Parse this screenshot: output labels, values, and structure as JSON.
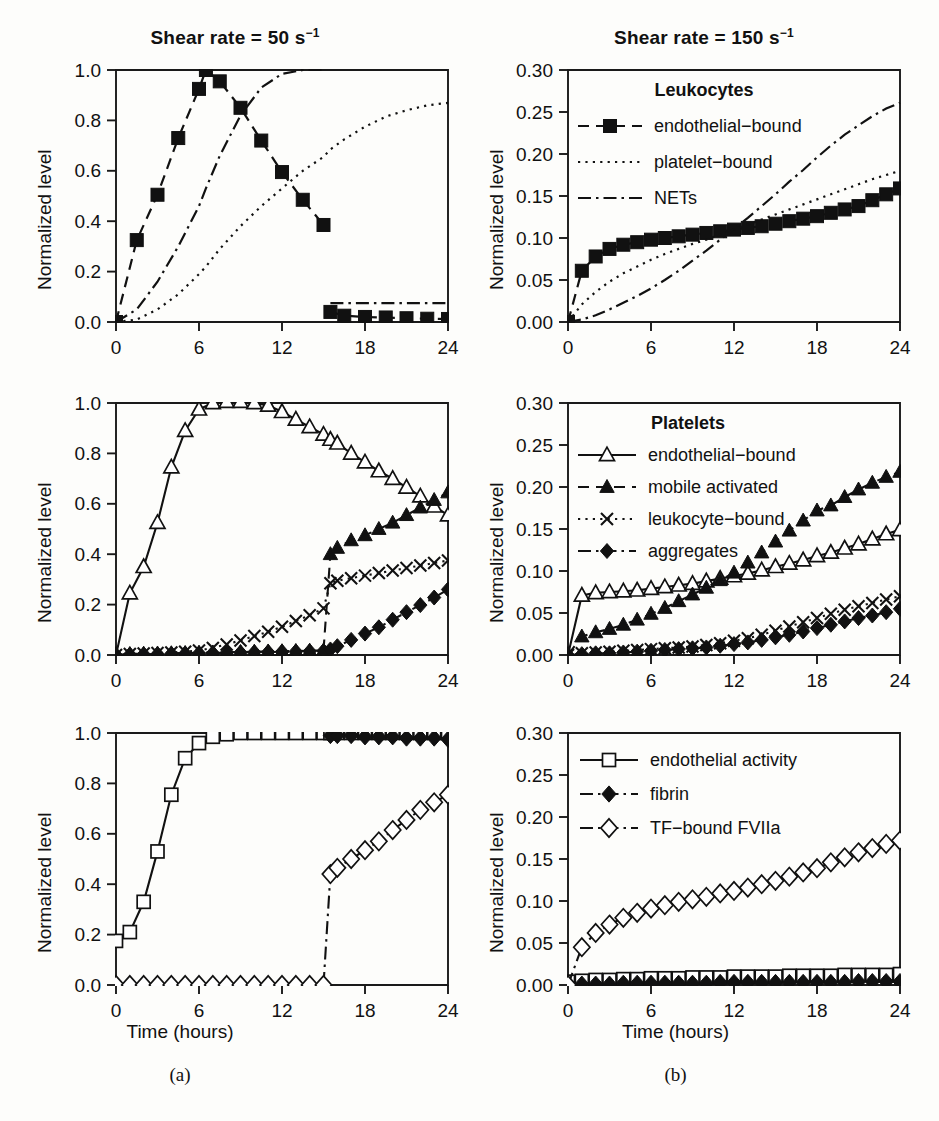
{
  "figure": {
    "subcaptions": [
      "(a)",
      "(b)"
    ],
    "xlabel": "Time (hours)",
    "ylabel": "Normalized level",
    "column_titles": [
      {
        "text_prefix": "Shear rate = 50 s",
        "exponent": "−1"
      },
      {
        "text_prefix": "Shear rate = 150 s",
        "exponent": "−1"
      }
    ]
  },
  "axes": {
    "x_ticks": [
      "0",
      "6",
      "12",
      "18",
      "24"
    ],
    "x_values": [
      0,
      6,
      12,
      18,
      24
    ],
    "xlim": [
      0,
      24
    ],
    "y_ticks_left": [
      "0.0",
      "0.2",
      "0.4",
      "0.6",
      "0.8",
      "1.0"
    ],
    "y_values_left": [
      0.0,
      0.2,
      0.4,
      0.6,
      0.8,
      1.0
    ],
    "ylim_left": [
      0,
      1.0
    ],
    "y_ticks_right": [
      "0.00",
      "0.05",
      "0.10",
      "0.15",
      "0.20",
      "0.25",
      "0.30"
    ],
    "y_values_right": [
      0.0,
      0.05,
      0.1,
      0.15,
      0.2,
      0.25,
      0.3
    ],
    "ylim_right": [
      0,
      0.3
    ]
  },
  "legends": {
    "leukocytes": {
      "title": "Leukocytes",
      "entries": [
        {
          "label": "endothelial−bound",
          "marker": "filled-square",
          "dash": "dashed"
        },
        {
          "label": "platelet−bound",
          "marker": "none",
          "dash": "dotted"
        },
        {
          "label": "NETs",
          "marker": "none",
          "dash": "dash-dot"
        }
      ]
    },
    "platelets": {
      "title": "Platelets",
      "entries": [
        {
          "label": "endothelial−bound",
          "marker": "open-triangle",
          "dash": "solid"
        },
        {
          "label": "mobile activated",
          "marker": "filled-triangle",
          "dash": "dashed"
        },
        {
          "label": "leukocyte−bound",
          "marker": "cross",
          "dash": "dotted"
        },
        {
          "label": "aggregates",
          "marker": "filled-diamond",
          "dash": "dash-dot"
        }
      ]
    },
    "coagulation": {
      "title": "",
      "entries": [
        {
          "label": "endothelial activity",
          "marker": "open-square",
          "dash": "solid"
        },
        {
          "label": "fibrin",
          "marker": "filled-diamond",
          "dash": "dash-dot"
        },
        {
          "label": "TF−bound FVIIa",
          "marker": "open-diamond",
          "dash": "dash-dot"
        }
      ]
    }
  },
  "chart_data": [
    {
      "id": "panel-a-top",
      "type": "line",
      "title": "Shear rate = 50 s^-1",
      "group": "Leukocytes",
      "xlabel": "Time (hours)",
      "ylabel": "Normalized level",
      "xlim": [
        0,
        24
      ],
      "ylim": [
        0,
        1.0
      ],
      "grid": false,
      "legend_position": "none",
      "x": [
        0,
        1.5,
        3,
        4.5,
        6,
        6.5,
        7.5,
        9,
        10.5,
        12,
        13.5,
        15,
        15.5,
        16.5,
        18,
        19.5,
        21,
        22.5,
        24
      ],
      "series": [
        {
          "name": "endothelial−bound",
          "marker": "filled-square",
          "dash": "dashed",
          "values": [
            0.0,
            0.325,
            0.505,
            0.73,
            0.925,
            1.0,
            0.955,
            0.85,
            0.72,
            0.595,
            0.485,
            0.385,
            0.04,
            0.025,
            0.02,
            0.018,
            0.015,
            0.013,
            0.012
          ]
        },
        {
          "name": "platelet−bound",
          "marker": "none",
          "dash": "dotted",
          "values": [
            0.0,
            0.01,
            0.05,
            0.11,
            0.19,
            0.22,
            0.29,
            0.38,
            0.46,
            0.53,
            0.6,
            0.655,
            0.685,
            0.725,
            0.775,
            0.815,
            0.84,
            0.86,
            0.87
          ]
        },
        {
          "name": "NETs",
          "marker": "none",
          "dash": "dash-dot",
          "values": [
            0.0,
            0.05,
            0.16,
            0.3,
            0.46,
            0.53,
            0.66,
            0.82,
            0.93,
            0.985,
            1.0,
            1.0,
            0.075,
            0.075,
            0.075,
            0.075,
            0.075,
            0.075,
            0.075
          ]
        }
      ]
    },
    {
      "id": "panel-a-middle",
      "type": "line",
      "group": "Platelets",
      "xlabel": "Time (hours)",
      "ylabel": "Normalized level",
      "xlim": [
        0,
        24
      ],
      "ylim": [
        0,
        1.0
      ],
      "grid": false,
      "legend_position": "none",
      "x": [
        0,
        1,
        2,
        3,
        4,
        5,
        6,
        7,
        8,
        9,
        10,
        11,
        12,
        13,
        14,
        15,
        15.5,
        16,
        17,
        18,
        19,
        20,
        21,
        22,
        23,
        24
      ],
      "series": [
        {
          "name": "endothelial−bound",
          "marker": "open-triangle",
          "dash": "solid",
          "values": [
            0.0,
            0.245,
            0.35,
            0.525,
            0.745,
            0.89,
            0.975,
            1.0,
            1.005,
            1.005,
            1.0,
            0.99,
            0.965,
            0.935,
            0.905,
            0.875,
            0.855,
            0.84,
            0.8,
            0.765,
            0.73,
            0.7,
            0.665,
            0.63,
            0.59,
            0.555
          ]
        },
        {
          "name": "mobile activated",
          "marker": "filled-triangle",
          "dash": "dashed",
          "values": [
            0.0,
            0.004,
            0.005,
            0.006,
            0.007,
            0.008,
            0.009,
            0.01,
            0.011,
            0.012,
            0.013,
            0.014,
            0.015,
            0.016,
            0.017,
            0.018,
            0.4,
            0.425,
            0.455,
            0.475,
            0.5,
            0.525,
            0.555,
            0.585,
            0.615,
            0.645
          ]
        },
        {
          "name": "leukocyte−bound",
          "marker": "cross",
          "dash": "dotted",
          "values": [
            0.0,
            0.004,
            0.006,
            0.008,
            0.01,
            0.013,
            0.018,
            0.028,
            0.042,
            0.058,
            0.075,
            0.092,
            0.112,
            0.135,
            0.158,
            0.185,
            0.285,
            0.295,
            0.305,
            0.315,
            0.325,
            0.335,
            0.345,
            0.355,
            0.365,
            0.375
          ]
        },
        {
          "name": "aggregates",
          "marker": "filled-diamond",
          "dash": "dash-dot",
          "values": [
            0.0,
            0.002,
            0.003,
            0.004,
            0.005,
            0.006,
            0.007,
            0.008,
            0.009,
            0.01,
            0.011,
            0.012,
            0.013,
            0.014,
            0.015,
            0.016,
            0.022,
            0.035,
            0.06,
            0.085,
            0.11,
            0.14,
            0.17,
            0.198,
            0.228,
            0.26
          ]
        }
      ]
    },
    {
      "id": "panel-a-bottom",
      "type": "line",
      "group": "Coagulation",
      "xlabel": "Time (hours)",
      "ylabel": "Normalized level",
      "xlim": [
        0,
        24
      ],
      "ylim": [
        0,
        1.0
      ],
      "grid": false,
      "legend_position": "none",
      "x": [
        0,
        1,
        2,
        3,
        4,
        5,
        6,
        7,
        8,
        9,
        10,
        11,
        12,
        13,
        14,
        15,
        15.5,
        16,
        17,
        18,
        19,
        20,
        21,
        22,
        23,
        24
      ],
      "series": [
        {
          "name": "endothelial activity",
          "marker": "open-square",
          "dash": "solid",
          "values": [
            0.175,
            0.21,
            0.33,
            0.53,
            0.755,
            0.9,
            0.96,
            0.985,
            0.995,
            1.0,
            1.0,
            1.0,
            1.0,
            1.0,
            1.0,
            1.0,
            1.0,
            1.0,
            1.0,
            1.0,
            1.0,
            1.0,
            1.0,
            1.0,
            1.0,
            1.0
          ]
        },
        {
          "name": "fibrin",
          "marker": "filled-diamond",
          "dash": "dash-dot",
          "values": [
            0.0,
            0.0,
            0.0,
            0.0,
            0.0,
            0.0,
            0.0,
            0.0,
            0.0,
            0.0,
            0.0,
            0.0,
            0.0,
            0.0,
            0.0,
            0.0,
            0.99,
            0.99,
            0.99,
            0.985,
            0.985,
            0.985,
            0.98,
            0.98,
            0.98,
            0.975
          ]
        },
        {
          "name": "TF−bound FVIIa",
          "marker": "open-diamond",
          "dash": "dash-dot",
          "values": [
            0.0,
            0.0,
            0.0,
            0.0,
            0.0,
            0.0,
            0.0,
            0.0,
            0.0,
            0.0,
            0.0,
            0.0,
            0.0,
            0.0,
            0.0,
            0.0,
            0.44,
            0.465,
            0.5,
            0.535,
            0.57,
            0.615,
            0.655,
            0.695,
            0.725,
            0.755
          ]
        }
      ]
    },
    {
      "id": "panel-b-top",
      "type": "line",
      "title": "Shear rate = 150 s^-1",
      "group": "Leukocytes",
      "xlabel": "Time (hours)",
      "ylabel": "Normalized level",
      "xlim": [
        0,
        24
      ],
      "ylim": [
        0,
        0.3
      ],
      "grid": false,
      "legend_position": "upper-left",
      "x": [
        0,
        1,
        2,
        3,
        4,
        5,
        6,
        7,
        8,
        9,
        10,
        11,
        12,
        13,
        14,
        15,
        16,
        17,
        18,
        19,
        20,
        21,
        22,
        23,
        24
      ],
      "series": [
        {
          "name": "endothelial−bound",
          "marker": "filled-square",
          "dash": "dashed",
          "values": [
            0.0,
            0.061,
            0.078,
            0.087,
            0.092,
            0.095,
            0.098,
            0.1,
            0.102,
            0.104,
            0.106,
            0.108,
            0.11,
            0.112,
            0.114,
            0.117,
            0.12,
            0.123,
            0.126,
            0.13,
            0.134,
            0.138,
            0.145,
            0.152,
            0.159
          ]
        },
        {
          "name": "platelet−bound",
          "marker": "none",
          "dash": "dotted",
          "values": [
            0.0,
            0.021,
            0.036,
            0.048,
            0.058,
            0.066,
            0.074,
            0.081,
            0.087,
            0.093,
            0.098,
            0.104,
            0.11,
            0.116,
            0.122,
            0.128,
            0.134,
            0.14,
            0.146,
            0.152,
            0.158,
            0.164,
            0.17,
            0.175,
            0.18
          ]
        },
        {
          "name": "NETs",
          "marker": "none",
          "dash": "dash-dot",
          "values": [
            0.0,
            0.003,
            0.008,
            0.015,
            0.023,
            0.031,
            0.04,
            0.05,
            0.061,
            0.073,
            0.085,
            0.098,
            0.111,
            0.124,
            0.138,
            0.152,
            0.167,
            0.181,
            0.196,
            0.21,
            0.223,
            0.234,
            0.245,
            0.254,
            0.261
          ]
        }
      ]
    },
    {
      "id": "panel-b-middle",
      "type": "line",
      "group": "Platelets",
      "xlabel": "Time (hours)",
      "ylabel": "Normalized level",
      "xlim": [
        0,
        24
      ],
      "ylim": [
        0,
        0.3
      ],
      "grid": false,
      "legend_position": "upper-left",
      "x": [
        0,
        1,
        2,
        3,
        4,
        5,
        6,
        7,
        8,
        9,
        10,
        11,
        12,
        13,
        14,
        15,
        16,
        17,
        18,
        19,
        20,
        21,
        22,
        23,
        24
      ],
      "series": [
        {
          "name": "endothelial−bound",
          "marker": "open-triangle",
          "dash": "solid",
          "values": [
            0.0,
            0.071,
            0.074,
            0.075,
            0.076,
            0.077,
            0.079,
            0.081,
            0.083,
            0.085,
            0.088,
            0.091,
            0.094,
            0.097,
            0.101,
            0.105,
            0.109,
            0.113,
            0.118,
            0.122,
            0.127,
            0.132,
            0.138,
            0.144,
            0.149
          ]
        },
        {
          "name": "mobile activated",
          "marker": "filled-triangle",
          "dash": "dashed",
          "values": [
            0.0,
            0.022,
            0.027,
            0.031,
            0.036,
            0.042,
            0.049,
            0.056,
            0.064,
            0.072,
            0.08,
            0.089,
            0.098,
            0.11,
            0.122,
            0.135,
            0.148,
            0.16,
            0.172,
            0.178,
            0.188,
            0.197,
            0.205,
            0.212,
            0.218
          ]
        },
        {
          "name": "leukocyte−bound",
          "marker": "cross",
          "dash": "dotted",
          "values": [
            0.0,
            0.002,
            0.003,
            0.004,
            0.005,
            0.006,
            0.007,
            0.008,
            0.009,
            0.01,
            0.012,
            0.014,
            0.017,
            0.02,
            0.024,
            0.029,
            0.034,
            0.039,
            0.044,
            0.049,
            0.054,
            0.058,
            0.062,
            0.066,
            0.07
          ]
        },
        {
          "name": "aggregates",
          "marker": "filled-diamond",
          "dash": "dash-dot",
          "values": [
            0.0,
            0.001,
            0.002,
            0.002,
            0.003,
            0.004,
            0.005,
            0.006,
            0.007,
            0.008,
            0.009,
            0.011,
            0.013,
            0.015,
            0.018,
            0.021,
            0.024,
            0.028,
            0.032,
            0.036,
            0.04,
            0.044,
            0.047,
            0.051,
            0.055
          ]
        }
      ]
    },
    {
      "id": "panel-b-bottom",
      "type": "line",
      "group": "Coagulation",
      "xlabel": "Time (hours)",
      "ylabel": "Normalized level",
      "xlim": [
        0,
        24
      ],
      "ylim": [
        0,
        0.3
      ],
      "grid": false,
      "legend_position": "upper-left",
      "x": [
        0,
        1,
        2,
        3,
        4,
        5,
        6,
        7,
        8,
        9,
        10,
        11,
        12,
        13,
        14,
        15,
        16,
        17,
        18,
        19,
        20,
        21,
        22,
        23,
        24
      ],
      "series": [
        {
          "name": "endothelial activity",
          "marker": "open-square",
          "dash": "solid",
          "values": [
            0.004,
            0.005,
            0.006,
            0.006,
            0.007,
            0.007,
            0.008,
            0.008,
            0.008,
            0.009,
            0.009,
            0.009,
            0.01,
            0.01,
            0.01,
            0.01,
            0.011,
            0.011,
            0.011,
            0.011,
            0.012,
            0.012,
            0.012,
            0.012,
            0.013
          ]
        },
        {
          "name": "fibrin",
          "marker": "filled-diamond",
          "dash": "dash-dot",
          "values": [
            0.0,
            0.001,
            0.001,
            0.001,
            0.002,
            0.002,
            0.002,
            0.002,
            0.002,
            0.002,
            0.002,
            0.003,
            0.003,
            0.003,
            0.003,
            0.003,
            0.003,
            0.003,
            0.003,
            0.003,
            0.003,
            0.004,
            0.004,
            0.004,
            0.004
          ]
        },
        {
          "name": "TF−bound FVIIa",
          "marker": "open-diamond",
          "dash": "dash-dot",
          "values": [
            0.0,
            0.045,
            0.062,
            0.072,
            0.08,
            0.086,
            0.091,
            0.095,
            0.099,
            0.102,
            0.105,
            0.109,
            0.112,
            0.116,
            0.12,
            0.124,
            0.129,
            0.134,
            0.139,
            0.146,
            0.152,
            0.158,
            0.163,
            0.168,
            0.172
          ]
        }
      ]
    }
  ]
}
